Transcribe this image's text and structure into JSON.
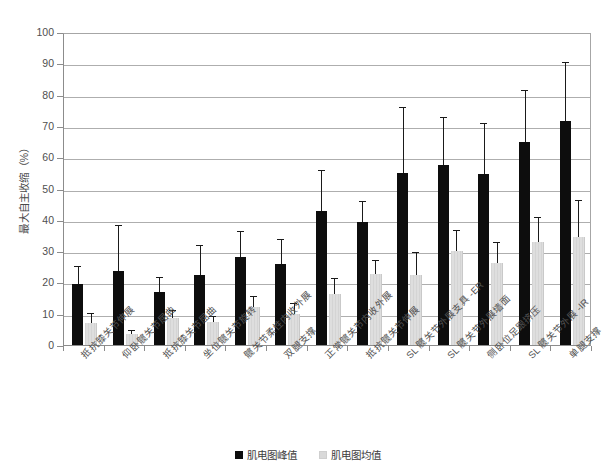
{
  "chart_data": {
    "type": "bar",
    "title": "",
    "xlabel": "",
    "ylabel": "最大自主收缩（%）",
    "ylim": [
      0,
      100
    ],
    "yticks": [
      0,
      10,
      20,
      30,
      40,
      50,
      60,
      70,
      80,
      90,
      100
    ],
    "grid": true,
    "legend_position": "bottom",
    "orientation": "vertical",
    "categories": [
      "抵抗膝关节伸展",
      "仰卧髋关节屈曲",
      "抵抗膝关节屈曲",
      "坐位髋关节旋转",
      "髋关节柔性内收外展",
      "双腿支撑",
      "正常髋关节内收外展",
      "抵抗髋关节伸展",
      "SL 髋关节外展支具 -ER",
      "SL 髋关节外展墙面",
      "侧卧位足跟挤压",
      "SL 髋关节外展 -IR",
      "单腿支撑"
    ],
    "series": [
      {
        "name": "肌电图峰值",
        "color": "#0d0d0d",
        "values": [
          19.5,
          23.5,
          17.0,
          22.5,
          28.0,
          25.8,
          42.8,
          39.3,
          54.8,
          57.5,
          54.5,
          64.8,
          71.5
        ],
        "errors_upper": [
          25.0,
          38.0,
          21.5,
          31.5,
          36.0,
          33.5,
          55.5,
          45.8,
          75.8,
          72.5,
          70.5,
          81.0,
          90.0
        ]
      },
      {
        "name": "肌电图均值",
        "color": "#d9d9d9",
        "values": [
          7.0,
          3.5,
          8.5,
          7.3,
          12.0,
          10.0,
          16.3,
          22.8,
          22.5,
          30.0,
          26.3,
          33.0,
          34.5
        ],
        "errors_upper": [
          9.8,
          4.5,
          11.0,
          9.0,
          15.5,
          13.0,
          21.0,
          27.0,
          29.5,
          36.5,
          32.5,
          40.5,
          46.0
        ]
      }
    ]
  },
  "legend": {
    "items": [
      {
        "label": "肌电图峰值"
      },
      {
        "label": "肌电图均值"
      }
    ]
  },
  "axis": {
    "y_title": "最大自主收缩（%）"
  }
}
